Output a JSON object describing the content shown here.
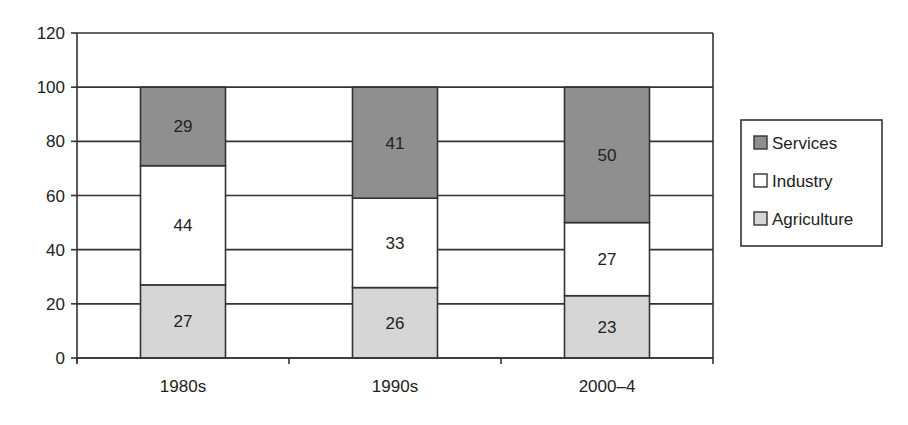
{
  "chart_data": {
    "type": "bar",
    "stacked": true,
    "title": "",
    "xlabel": "",
    "ylabel": "",
    "ylim": [
      0,
      120
    ],
    "yticks": [
      0,
      20,
      40,
      60,
      80,
      100,
      120
    ],
    "grid": true,
    "legend_position": "right",
    "categories": [
      "1980s",
      "1990s",
      "2000–4"
    ],
    "series": [
      {
        "name": "Agriculture",
        "values": [
          27,
          26,
          23
        ],
        "color": "#d6d6d6"
      },
      {
        "name": "Industry",
        "values": [
          44,
          33,
          27
        ],
        "color": "#ffffff"
      },
      {
        "name": "Services",
        "values": [
          29,
          41,
          50
        ],
        "color": "#8f8f8f"
      }
    ],
    "legend_order": [
      "Services",
      "Industry",
      "Agriculture"
    ]
  }
}
